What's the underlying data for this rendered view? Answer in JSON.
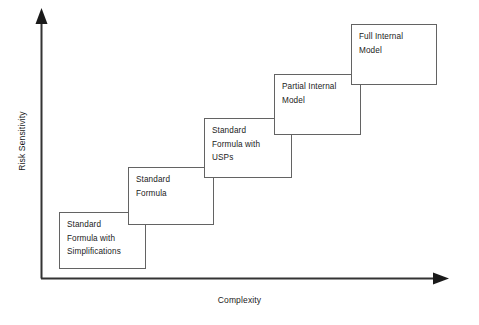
{
  "diagram": {
    "type": "staircase",
    "background_color": "#ffffff",
    "line_color": "#333333",
    "box_border_color": "#636363",
    "text_color": "#1b1b1b",
    "axes": {
      "y_axis_label": "Risk Sensitivity",
      "x_axis_label": "Complexity",
      "y_axis_arrow": "up-arrow-icon",
      "x_axis_arrow": "right-arrow-icon"
    },
    "steps": [
      {
        "id": "step-1",
        "label": "Standard Formula with Simplifications",
        "lines": [
          "Standard",
          "Formula with",
          "Simplifications"
        ],
        "order": 1
      },
      {
        "id": "step-2",
        "label": "Standard Formula",
        "lines": [
          "Standard",
          "Formula"
        ],
        "order": 2
      },
      {
        "id": "step-3",
        "label": "Standard Formula with USPs",
        "lines": [
          "Standard",
          "Formula with",
          "USPs"
        ],
        "order": 3
      },
      {
        "id": "step-4",
        "label": "Partial Internal Model",
        "lines": [
          "Partial Internal",
          "Model"
        ],
        "order": 4
      },
      {
        "id": "step-5",
        "label": "Full Internal Model",
        "lines": [
          "Full Internal",
          "Model"
        ],
        "order": 5
      }
    ]
  }
}
